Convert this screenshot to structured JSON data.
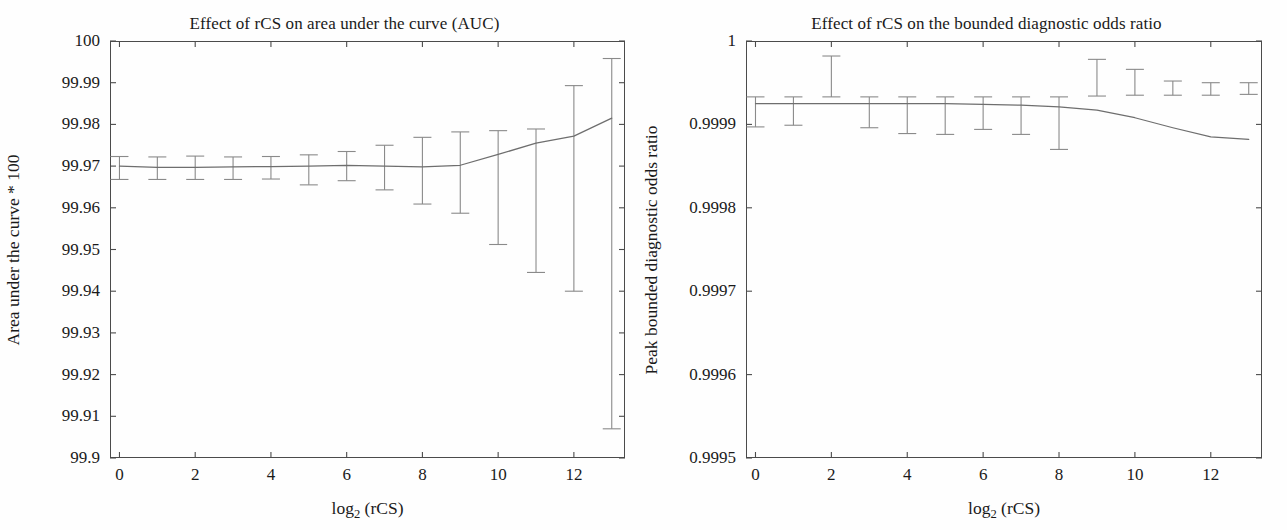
{
  "figure": {
    "background": "#fefefe",
    "line_color": "#6e6e6e",
    "errorbar_color": "#8a8a8a",
    "axis_color": "#4b4b4b"
  },
  "chart_data": [
    {
      "type": "line",
      "panel": "left",
      "title": "Effect of rCS on area under the curve (AUC)",
      "xlabel": "log2 (rCS)",
      "xlabel_base": "log",
      "xlabel_sub": "2",
      "xlabel_rest": " (rCS)",
      "ylabel": "Area under the curve * 100",
      "xlim": [
        -0.25,
        13.35
      ],
      "ylim": [
        99.9,
        100
      ],
      "grid": false,
      "legend": "none",
      "xticks": [
        0,
        2,
        4,
        6,
        8,
        10,
        12
      ],
      "xticklabels": [
        "0",
        "2",
        "4",
        "6",
        "8",
        "10",
        "12"
      ],
      "yticks": [
        99.9,
        99.91,
        99.92,
        99.93,
        99.94,
        99.95,
        99.96,
        99.97,
        99.98,
        99.99,
        100
      ],
      "yticklabels": [
        "99.9",
        "99.91",
        "99.92",
        "99.93",
        "99.94",
        "99.95",
        "99.96",
        "99.97",
        "99.98",
        "99.99",
        "100"
      ],
      "x": [
        0,
        1,
        2,
        3,
        4,
        5,
        6,
        7,
        8,
        9,
        10,
        11,
        12,
        13
      ],
      "values": [
        99.97,
        99.9697,
        99.9697,
        99.9698,
        99.9699,
        99.97,
        99.9702,
        99.97,
        99.9698,
        99.9702,
        99.9728,
        99.9755,
        99.9772,
        99.9815
      ],
      "err_upper": [
        99.9723,
        99.9722,
        99.9724,
        99.9722,
        99.9723,
        99.9727,
        99.9735,
        99.975,
        99.9769,
        99.9782,
        99.9785,
        99.9789,
        99.9893,
        99.9958
      ],
      "err_lower": [
        99.9668,
        99.9668,
        99.9668,
        99.9668,
        99.9669,
        99.9655,
        99.9665,
        99.9643,
        99.9609,
        99.9587,
        99.9512,
        99.9445,
        99.94,
        99.907
      ]
    },
    {
      "type": "line",
      "panel": "right",
      "title": "Effect of rCS on the bounded diagnostic odds ratio",
      "xlabel": "log2 (rCS)",
      "xlabel_base": "log",
      "xlabel_sub": "2",
      "xlabel_rest": " (rCS)",
      "ylabel": "Peak bounded diagnostic odds ratio",
      "xlim": [
        -0.25,
        13.35
      ],
      "ylim": [
        0.9995,
        1.0
      ],
      "grid": false,
      "legend": "none",
      "xticks": [
        0,
        2,
        4,
        6,
        8,
        10,
        12
      ],
      "xticklabels": [
        "0",
        "2",
        "4",
        "6",
        "8",
        "10",
        "12"
      ],
      "yticks": [
        0.9995,
        0.9996,
        0.9997,
        0.9998,
        0.9999,
        1.0
      ],
      "yticklabels": [
        "0.9995",
        "0.9996",
        "0.9997",
        "0.9998",
        "0.9999",
        "1"
      ],
      "x": [
        0,
        1,
        2,
        3,
        4,
        5,
        6,
        7,
        8,
        9,
        10,
        11,
        12,
        13
      ],
      "values": [
        0.999925,
        0.999925,
        0.999925,
        0.999925,
        0.999925,
        0.999925,
        0.999924,
        0.999923,
        0.999921,
        0.999917,
        0.999908,
        0.999896,
        0.999885,
        0.999882
      ],
      "err_upper": [
        0.999933,
        0.999933,
        0.999933,
        0.999933,
        0.999933,
        0.999933,
        0.999933,
        0.999933,
        0.999933,
        0.999934,
        0.999935,
        0.999935,
        0.999935,
        0.999936
      ],
      "err_lower": [
        0.999897,
        0.999899,
        0.999982,
        0.999896,
        0.999889,
        0.999888,
        0.999894,
        0.999888,
        0.99987,
        0.999978,
        0.999966,
        0.999952,
        0.99995,
        0.99995
      ]
    }
  ]
}
